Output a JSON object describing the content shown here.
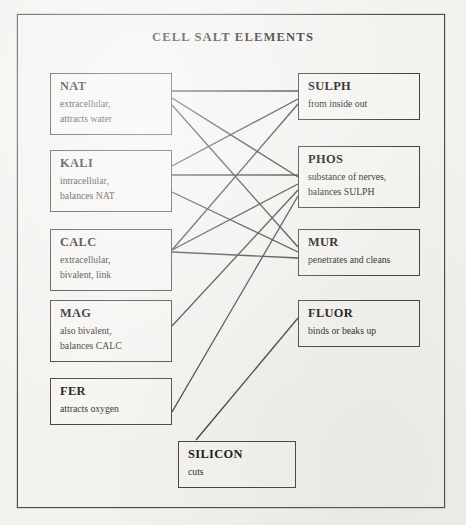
{
  "diagram": {
    "title": "CELL SALT ELEMENTS",
    "frame_color": "#4a4a48",
    "background_color": "#f3f2ef",
    "node_border_color": "#41413f",
    "edge_color": "#3a3a38"
  },
  "nodes": {
    "left": [
      {
        "id": "nat",
        "name": "NAT",
        "lines": [
          "extracellular,",
          "attracts water"
        ],
        "x": 50,
        "y": 73,
        "w": 122,
        "h": 62
      },
      {
        "id": "kali",
        "name": "KALI",
        "lines": [
          "intracellular,",
          "balances NAT"
        ],
        "x": 50,
        "y": 150,
        "w": 122,
        "h": 62
      },
      {
        "id": "calc",
        "name": "CALC",
        "lines": [
          "extracellular,",
          "bivalent, link"
        ],
        "x": 50,
        "y": 229,
        "w": 122,
        "h": 62
      },
      {
        "id": "mag",
        "name": "MAG",
        "lines": [
          "also bivalent,",
          "balances CALC"
        ],
        "x": 50,
        "y": 300,
        "w": 122,
        "h": 62
      },
      {
        "id": "fer",
        "name": "FER",
        "lines": [
          "attracts oxygen"
        ],
        "x": 50,
        "y": 378,
        "w": 122,
        "h": 47
      }
    ],
    "right": [
      {
        "id": "sulph",
        "name": "SULPH",
        "lines": [
          "from inside out"
        ],
        "x": 298,
        "y": 73,
        "w": 122,
        "h": 47
      },
      {
        "id": "phos",
        "name": "PHOS",
        "lines": [
          "substance of nerves,",
          "balances SULPH"
        ],
        "x": 298,
        "y": 146,
        "w": 122,
        "h": 62
      },
      {
        "id": "mur",
        "name": "MUR",
        "lines": [
          "penetrates and cleans"
        ],
        "x": 298,
        "y": 229,
        "w": 122,
        "h": 47
      },
      {
        "id": "fluor",
        "name": "FLUOR",
        "lines": [
          "binds or beaks up"
        ],
        "x": 298,
        "y": 300,
        "w": 122,
        "h": 47
      }
    ],
    "bottom": [
      {
        "id": "silicon",
        "name": "SILICON",
        "lines": [
          "cuts"
        ],
        "x": 178,
        "y": 441,
        "w": 118,
        "h": 47
      }
    ]
  },
  "edges": [
    {
      "from": "nat",
      "to": "sulph",
      "x1": 172,
      "y1": 91,
      "x2": 298,
      "y2": 91
    },
    {
      "from": "nat",
      "to": "phos",
      "x1": 172,
      "y1": 98,
      "x2": 298,
      "y2": 177
    },
    {
      "from": "nat",
      "to": "mur",
      "x1": 172,
      "y1": 105,
      "x2": 298,
      "y2": 247
    },
    {
      "from": "kali",
      "to": "sulph",
      "x1": 172,
      "y1": 166,
      "x2": 298,
      "y2": 99
    },
    {
      "from": "kali",
      "to": "phos",
      "x1": 172,
      "y1": 175,
      "x2": 298,
      "y2": 175
    },
    {
      "from": "kali",
      "to": "mur",
      "x1": 172,
      "y1": 192,
      "x2": 298,
      "y2": 252
    },
    {
      "from": "calc",
      "to": "sulph",
      "x1": 172,
      "y1": 250,
      "x2": 298,
      "y2": 104
    },
    {
      "from": "calc",
      "to": "phos",
      "x1": 172,
      "y1": 250,
      "x2": 298,
      "y2": 184
    },
    {
      "from": "calc",
      "to": "mur",
      "x1": 172,
      "y1": 252,
      "x2": 298,
      "y2": 258
    },
    {
      "from": "mag",
      "to": "phos",
      "x1": 172,
      "y1": 326,
      "x2": 298,
      "y2": 190
    },
    {
      "from": "fer",
      "to": "phos",
      "x1": 172,
      "y1": 412,
      "x2": 298,
      "y2": 196
    },
    {
      "from": "fer",
      "to": "fluor",
      "x1": 196,
      "y1": 440,
      "x2": 298,
      "y2": 318
    }
  ]
}
